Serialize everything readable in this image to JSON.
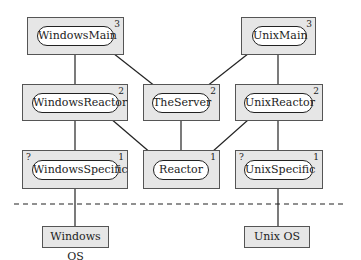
{
  "diagram": {
    "modules": [
      {
        "id": "windows-main",
        "label": "WindowsMain",
        "level": "3",
        "marker": ""
      },
      {
        "id": "unix-main",
        "label": "UnixMain",
        "level": "3",
        "marker": ""
      },
      {
        "id": "windows-reactor",
        "label": "WindowsReactor",
        "level": "2",
        "marker": ""
      },
      {
        "id": "the-server",
        "label": "TheServer",
        "level": "2",
        "marker": ""
      },
      {
        "id": "unix-reactor",
        "label": "UnixReactor",
        "level": "2",
        "marker": ""
      },
      {
        "id": "windows-specific",
        "label": "WindowsSpecific",
        "level": "1",
        "marker": "?"
      },
      {
        "id": "reactor",
        "label": "Reactor",
        "level": "1",
        "marker": ""
      },
      {
        "id": "unix-specific",
        "label": "UnixSpecific",
        "level": "1",
        "marker": "?"
      }
    ],
    "platforms": [
      {
        "id": "windows-os",
        "label": "Windows OS"
      },
      {
        "id": "unix-os",
        "label": "Unix OS"
      }
    ],
    "edges": [
      {
        "from": "WindowsMain",
        "to": "WindowsReactor",
        "type": "dot-line"
      },
      {
        "from": "WindowsMain",
        "to": "TheServer",
        "type": "dot-line"
      },
      {
        "from": "UnixMain",
        "to": "TheServer",
        "type": "dot-line"
      },
      {
        "from": "UnixMain",
        "to": "UnixReactor",
        "type": "dot-line"
      },
      {
        "from": "WindowsReactor",
        "to": "WindowsSpecific",
        "type": "dot-line"
      },
      {
        "from": "WindowsReactor",
        "to": "Reactor",
        "type": "arrow"
      },
      {
        "from": "TheServer",
        "to": "Reactor",
        "type": "open-circle-line"
      },
      {
        "from": "UnixReactor",
        "to": "Reactor",
        "type": "arrow"
      },
      {
        "from": "UnixReactor",
        "to": "UnixSpecific",
        "type": "dot-line"
      },
      {
        "from": "WindowsSpecific",
        "to": "Windows OS",
        "type": "dot-line"
      },
      {
        "from": "UnixSpecific",
        "to": "Unix OS",
        "type": "dot-line"
      }
    ],
    "separator": "dashed"
  }
}
